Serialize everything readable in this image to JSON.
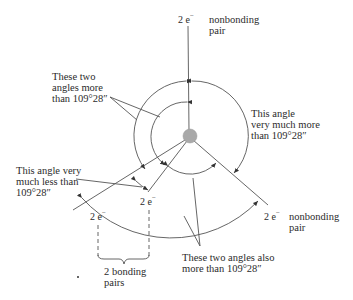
{
  "diagram": {
    "title": "",
    "electron_pair_label": "2 e",
    "electron_superscript": "−",
    "labels": {
      "top_pair": {
        "count": "2 e",
        "sup": "−",
        "desc_line1": "nonbonding",
        "desc_line2": "pair"
      },
      "right_pair": {
        "count": "2 e",
        "sup": "−",
        "desc_line1": "nonbonding",
        "desc_line2": "pair"
      },
      "left_bond": {
        "count": "2 e",
        "sup": "−"
      },
      "middle_bond": {
        "count": "2 e",
        "sup": "−"
      },
      "bonding_pairs": {
        "line1": "2 bonding",
        "line2": "pairs"
      }
    },
    "annotations": {
      "two_angles_more": {
        "line1": "These two",
        "line2": "angles more",
        "line3": "than 109°28″"
      },
      "angle_much_more": {
        "line1": "This angle",
        "line2": "very much more",
        "line3": "than 109°28″"
      },
      "angle_much_less": {
        "line1": "This angle very",
        "line2": "much less than",
        "line3": "109°28″"
      },
      "two_angles_also_more": {
        "line1": "These two angles also",
        "line2": "more than 109°28″"
      }
    },
    "colors": {
      "line": "#555555",
      "nucleus": "#a9a9a9",
      "text": "#2b2b2b"
    }
  }
}
